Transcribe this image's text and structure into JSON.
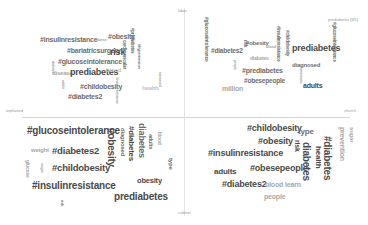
{
  "axes": {
    "top": "labor",
    "bottom": "cabinet",
    "left": "orphaned",
    "right": "church",
    "top_right_tag": "prediabetes [M1]"
  },
  "quadrants": {
    "top_left": {
      "words": [
        {
          "text": "#insulinresistance",
          "tone": "mid"
        },
        {
          "text": "#obesity",
          "tone": "mid"
        },
        {
          "text": "#bariatricsurgery",
          "tone": "mid"
        },
        {
          "text": "risk",
          "tone": "dark"
        },
        {
          "text": "#glucoseintolerance",
          "tone": "mid"
        },
        {
          "text": "prediabetes",
          "tone": "dark"
        },
        {
          "text": "#childobesity",
          "tone": "mid"
        },
        {
          "text": "#diabetes2",
          "tone": "mid"
        },
        {
          "text": "disease",
          "tone": "light"
        },
        {
          "text": "blood",
          "tone": "faint"
        },
        {
          "text": "health",
          "tone": "faint"
        },
        {
          "text": "cardiovascular",
          "tone": "mid"
        },
        {
          "text": "#prediabetes",
          "tone": "mid"
        },
        {
          "text": "#hypertension",
          "tone": "mid"
        },
        {
          "text": "increased",
          "tone": "light"
        },
        {
          "text": "adults",
          "tone": "light"
        },
        {
          "text": "diabetes",
          "tone": "light"
        },
        {
          "text": "obese",
          "tone": "light"
        }
      ]
    },
    "top_right": {
      "words": [
        {
          "text": "#glucoseintolerance",
          "tone": "mid"
        },
        {
          "text": "#diabetes2",
          "tone": "mid"
        },
        {
          "text": "obesity",
          "tone": "mid"
        },
        {
          "text": "#obesity",
          "tone": "mid"
        },
        {
          "text": "diabetes",
          "tone": "light"
        },
        {
          "text": "#prediabetes",
          "tone": "mid"
        },
        {
          "text": "#obesepeople",
          "tone": "mid"
        },
        {
          "text": "million",
          "tone": "light"
        },
        {
          "text": "prediabetes",
          "tone": "dark"
        },
        {
          "text": "diagnosed",
          "tone": "mid"
        },
        {
          "text": "adults",
          "tone": "dark"
        },
        {
          "text": "#insulinresistance",
          "tone": "mid"
        },
        {
          "text": "#childobesity",
          "tone": "mid"
        },
        {
          "text": "risk",
          "tone": "mid"
        },
        {
          "text": "type",
          "tone": "mid"
        },
        {
          "text": "people",
          "tone": "light"
        },
        {
          "text": "blood",
          "tone": "light"
        },
        {
          "text": "americans",
          "tone": "light"
        }
      ]
    },
    "bottom_left": {
      "words": [
        {
          "text": "#glucoseintolerance",
          "tone": "dark"
        },
        {
          "text": "#diabetes2",
          "tone": "dark"
        },
        {
          "text": "#childobesity",
          "tone": "dark"
        },
        {
          "text": "#insulinresistance",
          "tone": "dark"
        },
        {
          "text": "#obesity",
          "tone": "dark"
        },
        {
          "text": "#diabetes",
          "tone": "dark"
        },
        {
          "text": "diabetes",
          "tone": "mid"
        },
        {
          "text": "obesity",
          "tone": "dark"
        },
        {
          "text": "prediabetes",
          "tone": "dark"
        },
        {
          "text": "diagnosed",
          "tone": "mid"
        },
        {
          "text": "adults",
          "tone": "mid"
        },
        {
          "text": "blood",
          "tone": "light"
        },
        {
          "text": "type",
          "tone": "mid"
        },
        {
          "text": "weight",
          "tone": "light"
        },
        {
          "text": "glucose",
          "tone": "light"
        },
        {
          "text": "sugar",
          "tone": "light"
        },
        {
          "text": "risk",
          "tone": "mid"
        }
      ]
    },
    "bottom_right": {
      "words": [
        {
          "text": "#childobesity",
          "tone": "dark"
        },
        {
          "text": "#obesity",
          "tone": "dark"
        },
        {
          "text": "#insulinresistance",
          "tone": "dark"
        },
        {
          "text": "adults",
          "tone": "dark"
        },
        {
          "text": "#obesepeople",
          "tone": "dark"
        },
        {
          "text": "#diabetes2",
          "tone": "dark"
        },
        {
          "text": "blood",
          "tone": "light"
        },
        {
          "text": "learn",
          "tone": "light"
        },
        {
          "text": "people",
          "tone": "light"
        },
        {
          "text": "type",
          "tone": "mid"
        },
        {
          "text": "risk",
          "tone": "dark"
        },
        {
          "text": "diabetes",
          "tone": "dark"
        },
        {
          "text": "health",
          "tone": "dark"
        },
        {
          "text": "#diabetes",
          "tone": "dark"
        },
        {
          "text": "prevention",
          "tone": "light"
        },
        {
          "text": "sugar",
          "tone": "light"
        }
      ]
    }
  }
}
